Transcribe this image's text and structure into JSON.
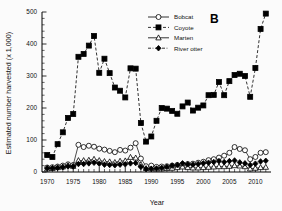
{
  "figure": {
    "panel_label": "B",
    "background": "#fbfbfb",
    "ink_color": "#000000"
  },
  "chart_data": {
    "type": "line",
    "title": "",
    "subtitle": "",
    "xlabel": "Year",
    "ylabel": "Estimated number harvested (x 1,000)",
    "xlim": [
      1969,
      2013
    ],
    "ylim": [
      0,
      500
    ],
    "xticks": [
      1970,
      1975,
      1980,
      1985,
      1990,
      1995,
      2000,
      2005,
      2010
    ],
    "xtick_labels": [
      "1970",
      "1975",
      "1980",
      "1985",
      "1990",
      "1995",
      "2000",
      "2005",
      "2010"
    ],
    "yticks": [
      0,
      100,
      200,
      300,
      400,
      500
    ],
    "ytick_labels": [
      "0",
      "100",
      "200",
      "300",
      "400",
      "500"
    ],
    "yminor_step": 20,
    "grid": false,
    "legend_position": "top-center",
    "annotations": [
      {
        "text": "B",
        "position": "top-right"
      }
    ],
    "x": [
      1970,
      1971,
      1972,
      1973,
      1974,
      1975,
      1976,
      1977,
      1978,
      1979,
      1980,
      1981,
      1982,
      1983,
      1984,
      1985,
      1986,
      1987,
      1988,
      1989,
      1990,
      1991,
      1992,
      1993,
      1994,
      1995,
      1996,
      1997,
      1998,
      1999,
      2000,
      2001,
      2002,
      2003,
      2004,
      2005,
      2006,
      2007,
      2008,
      2009,
      2010,
      2011,
      2012
    ],
    "series": [
      {
        "name": "Bobcat",
        "marker": "open-circle",
        "linestyle": "solid",
        "values": [
          14,
          15,
          17,
          20,
          24,
          22,
          85,
          78,
          82,
          79,
          73,
          70,
          66,
          62,
          69,
          67,
          76,
          90,
          42,
          18,
          20,
          16,
          17,
          18,
          20,
          22,
          24,
          25,
          26,
          29,
          32,
          37,
          40,
          45,
          51,
          60,
          78,
          72,
          68,
          40,
          47,
          60,
          62
        ]
      },
      {
        "name": "Coyote",
        "marker": "filled-square",
        "linestyle": "dashed",
        "values": [
          53,
          47,
          87,
          124,
          169,
          181,
          360,
          369,
          395,
          425,
          310,
          354,
          309,
          264,
          254,
          233,
          324,
          323,
          153,
          95,
          111,
          160,
          200,
          198,
          191,
          182,
          205,
          217,
          192,
          201,
          208,
          240,
          241,
          281,
          240,
          284,
          303,
          307,
          300,
          235,
          325,
          447,
          495
        ]
      },
      {
        "name": "Marten",
        "marker": "open-triangle",
        "linestyle": "solid",
        "values": [
          10,
          11,
          14,
          16,
          20,
          18,
          36,
          36,
          37,
          40,
          36,
          33,
          32,
          30,
          34,
          35,
          46,
          44,
          23,
          11,
          10,
          9,
          10,
          11,
          12,
          14,
          16,
          14,
          13,
          13,
          14,
          15,
          16,
          17,
          17,
          18,
          20,
          19,
          17,
          10,
          12,
          14,
          15
        ]
      },
      {
        "name": "River otter",
        "marker": "filled-diamond",
        "linestyle": "dash-dot",
        "values": [
          12,
          12,
          13,
          15,
          18,
          17,
          25,
          25,
          27,
          29,
          26,
          23,
          22,
          21,
          23,
          24,
          27,
          28,
          16,
          9,
          10,
          11,
          13,
          16,
          20,
          22,
          27,
          24,
          23,
          25,
          27,
          29,
          31,
          34,
          31,
          34,
          36,
          30,
          27,
          22,
          26,
          33,
          35
        ]
      }
    ]
  }
}
